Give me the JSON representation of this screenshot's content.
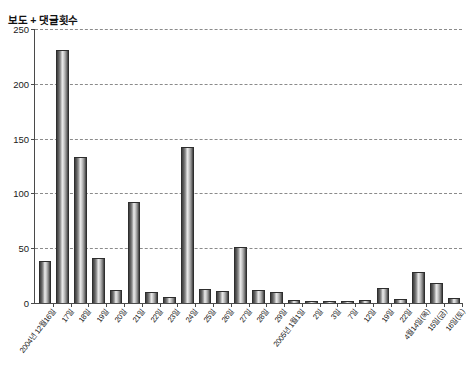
{
  "header": {
    "strip_text": "​"
  },
  "chart_data": {
    "type": "bar",
    "title": "보도 + 댓글횟수",
    "xlabel": "",
    "ylabel": "",
    "ylim": [
      0,
      250
    ],
    "yticks": [
      0,
      50,
      100,
      150,
      200,
      250
    ],
    "grid": true,
    "legend": "none",
    "categories": [
      "2004년 12월16일",
      "17일",
      "18일",
      "19일",
      "20일",
      "21일",
      "22일",
      "23일",
      "24일",
      "25일",
      "26일",
      "27일",
      "28일",
      "29일",
      "2005년 1월1일",
      "2일",
      "3일",
      "7일",
      "12일",
      "19일",
      "22일",
      "4월14일(목)",
      "15일(금)",
      "16일(토)"
    ],
    "values": [
      37,
      230,
      132,
      40,
      11,
      91,
      9,
      5,
      141,
      12,
      10,
      50,
      11,
      9,
      2,
      1,
      1,
      1,
      2,
      13,
      3,
      27,
      17,
      4
    ],
    "series": [
      {
        "name": "보도 + 댓글횟수",
        "values": [
          37,
          230,
          132,
          40,
          11,
          91,
          9,
          5,
          141,
          12,
          10,
          50,
          11,
          9,
          2,
          1,
          1,
          1,
          2,
          13,
          3,
          27,
          17,
          4
        ]
      }
    ]
  },
  "colors": {
    "bar_dark": "#3d3d3d",
    "bar_light": "#eaeaea",
    "axis": "#4a4a4a",
    "grid": "#8b8b8b",
    "background": "#ffffff"
  }
}
